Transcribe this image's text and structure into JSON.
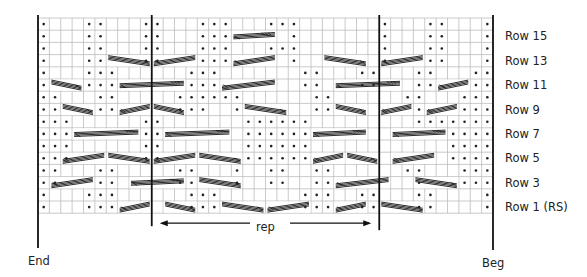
{
  "chart": {
    "title": "",
    "cols": 40,
    "rows": 16,
    "grid": {
      "x0": 38,
      "y0": 18,
      "cell_w": 11.375,
      "cell_h": 12.2
    },
    "colors": {
      "grid": "#bdbdbd",
      "line": "#111111",
      "dot": "#222222",
      "text": "#222222"
    },
    "row_labels": [
      {
        "row": 15,
        "label": "Row 15"
      },
      {
        "row": 13,
        "label": "Row 13"
      },
      {
        "row": 11,
        "label": "Row 11"
      },
      {
        "row": 9,
        "label": "Row 9"
      },
      {
        "row": 7,
        "label": "Row 7"
      },
      {
        "row": 5,
        "label": "Row 5"
      },
      {
        "row": 3,
        "label": "Row 3"
      },
      {
        "row": 1,
        "label": "Row 1 (RS)"
      }
    ],
    "end_label": "End",
    "beg_label": "Beg",
    "rep_label": "rep",
    "rep_cols": [
      10,
      30
    ],
    "purl_dots": {
      "16": [
        0,
        4,
        5,
        9,
        10,
        14,
        15,
        16,
        20,
        21,
        22,
        30,
        34,
        35,
        39
      ],
      "15": [
        0,
        4,
        5,
        9,
        10,
        14,
        15,
        16,
        22,
        30,
        34,
        35,
        39
      ],
      "14": [
        0,
        4,
        5,
        9,
        10,
        14,
        15,
        16,
        20,
        21,
        22,
        30,
        34,
        35,
        39
      ],
      "13": [
        0,
        4,
        5,
        9,
        10,
        14,
        15,
        16,
        22,
        30,
        34,
        35,
        39
      ],
      "12": [
        0,
        4,
        5,
        6,
        13,
        14,
        15,
        23,
        24,
        28,
        29,
        33,
        34,
        38,
        39
      ],
      "11": [
        0,
        4,
        5,
        6,
        13,
        14,
        15,
        23,
        24,
        28,
        29,
        33,
        34,
        38,
        39
      ],
      "10": [
        0,
        1,
        5,
        6,
        12,
        13,
        14,
        15,
        16,
        17,
        24,
        25,
        32,
        33,
        37,
        38,
        39
      ],
      "9": [
        0,
        1,
        5,
        6,
        12,
        13,
        14,
        17,
        24,
        25,
        33,
        37,
        38,
        39
      ],
      "8": [
        0,
        1,
        2,
        9,
        10,
        18,
        19,
        20,
        21,
        22,
        23,
        33,
        34,
        35,
        36,
        37,
        38,
        39
      ],
      "7": [
        0,
        1,
        2,
        9,
        10,
        18,
        19,
        20,
        21,
        22,
        23,
        36,
        37,
        38,
        39
      ],
      "6": [
        0,
        1,
        2,
        9,
        10,
        18,
        19,
        20,
        21,
        22,
        23,
        36,
        37,
        38,
        39
      ],
      "5": [
        0,
        1,
        2,
        9,
        10,
        18,
        19,
        20,
        21,
        22,
        23,
        36,
        37,
        38,
        39
      ],
      "4": [
        0,
        1,
        5,
        6,
        12,
        13,
        17,
        20,
        21,
        24,
        25,
        32,
        33,
        37,
        38,
        39
      ],
      "3": [
        0,
        1,
        5,
        6,
        12,
        13,
        17,
        20,
        21,
        24,
        25,
        33,
        37,
        38,
        39
      ],
      "2": [
        0,
        4,
        5,
        6,
        13,
        14,
        15,
        23,
        24,
        25,
        28,
        29,
        33,
        34,
        39
      ],
      "1": [
        0,
        4,
        5,
        6,
        13,
        14,
        15,
        23,
        24,
        25,
        28,
        29,
        33,
        34,
        39
      ]
    },
    "cables": [
      {
        "row": 13,
        "from": 6,
        "to": 10,
        "dir": "down"
      },
      {
        "row": 13,
        "from": 10,
        "to": 14,
        "dir": "up"
      },
      {
        "row": 13,
        "from": 17,
        "to": 21,
        "dir": "up"
      },
      {
        "row": 13,
        "from": 25,
        "to": 29,
        "dir": "down"
      },
      {
        "row": 13,
        "from": 30,
        "to": 34,
        "dir": "up"
      },
      {
        "row": 15,
        "from": 17,
        "to": 21,
        "dir": "flat"
      },
      {
        "row": 11,
        "from": 1,
        "to": 4,
        "dir": "down"
      },
      {
        "row": 11,
        "from": 7,
        "to": 13,
        "dir": "flat"
      },
      {
        "row": 11,
        "from": 16,
        "to": 21,
        "dir": "up"
      },
      {
        "row": 11,
        "from": 26,
        "to": 32,
        "dir": "flat"
      },
      {
        "row": 11,
        "from": 35,
        "to": 38,
        "dir": "up"
      },
      {
        "row": 9,
        "from": 2,
        "to": 5,
        "dir": "down"
      },
      {
        "row": 9,
        "from": 7,
        "to": 10,
        "dir": "up"
      },
      {
        "row": 9,
        "from": 10,
        "to": 13,
        "dir": "down"
      },
      {
        "row": 9,
        "from": 18,
        "to": 22,
        "dir": "down"
      },
      {
        "row": 9,
        "from": 26,
        "to": 29,
        "dir": "down"
      },
      {
        "row": 9,
        "from": 30,
        "to": 33,
        "dir": "up"
      },
      {
        "row": 9,
        "from": 34,
        "to": 37,
        "dir": "up"
      },
      {
        "row": 7,
        "from": 3,
        "to": 9,
        "dir": "flat"
      },
      {
        "row": 7,
        "from": 11,
        "to": 17,
        "dir": "flat"
      },
      {
        "row": 7,
        "from": 24,
        "to": 29,
        "dir": "flat"
      },
      {
        "row": 7,
        "from": 31,
        "to": 36,
        "dir": "flat"
      },
      {
        "row": 5,
        "from": 2,
        "to": 6,
        "dir": "up"
      },
      {
        "row": 5,
        "from": 6,
        "to": 10,
        "dir": "down"
      },
      {
        "row": 5,
        "from": 10,
        "to": 14,
        "dir": "up"
      },
      {
        "row": 5,
        "from": 14,
        "to": 18,
        "dir": "down"
      },
      {
        "row": 5,
        "from": 24,
        "to": 27,
        "dir": "up"
      },
      {
        "row": 5,
        "from": 27,
        "to": 30,
        "dir": "down"
      },
      {
        "row": 5,
        "from": 31,
        "to": 35,
        "dir": "up"
      },
      {
        "row": 3,
        "from": 1,
        "to": 5,
        "dir": "up"
      },
      {
        "row": 3,
        "from": 8,
        "to": 13,
        "dir": "flat"
      },
      {
        "row": 3,
        "from": 14,
        "to": 18,
        "dir": "down"
      },
      {
        "row": 3,
        "from": 26,
        "to": 31,
        "dir": "up"
      },
      {
        "row": 3,
        "from": 33,
        "to": 37,
        "dir": "down"
      },
      {
        "row": 1,
        "from": 7,
        "to": 10,
        "dir": "up"
      },
      {
        "row": 1,
        "from": 11,
        "to": 14,
        "dir": "down"
      },
      {
        "row": 1,
        "from": 16,
        "to": 20,
        "dir": "down"
      },
      {
        "row": 1,
        "from": 20,
        "to": 24,
        "dir": "up"
      },
      {
        "row": 1,
        "from": 26,
        "to": 29,
        "dir": "up"
      },
      {
        "row": 1,
        "from": 30,
        "to": 34,
        "dir": "down"
      }
    ]
  }
}
